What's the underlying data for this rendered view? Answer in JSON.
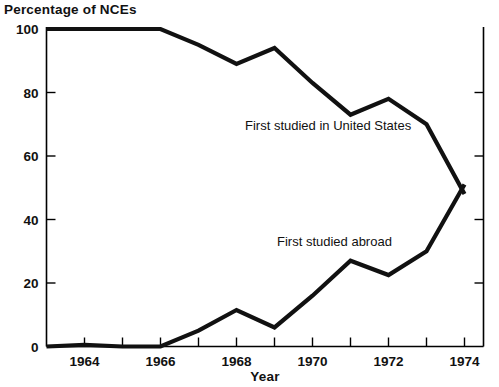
{
  "chart_data": {
    "type": "line",
    "title": "Percentage  of NCEs",
    "xlabel": "Year",
    "ylabel": "Percentage  of NCEs",
    "xlim": [
      1963,
      1974.5
    ],
    "ylim": [
      0,
      100
    ],
    "grid": false,
    "legend_position": "inline-annotation",
    "x": [
      1963,
      1964,
      1965,
      1966,
      1967,
      1968,
      1969,
      1970,
      1971,
      1972,
      1973,
      1974
    ],
    "xtick_labels": [
      "1964",
      "1966",
      "1968",
      "1970",
      "1972",
      "1974"
    ],
    "xtick_values": [
      1964,
      1966,
      1968,
      1970,
      1972,
      1974
    ],
    "ytick_labels": [
      "0",
      "20",
      "40",
      "60",
      "80",
      "100"
    ],
    "ytick_values": [
      0,
      20,
      40,
      60,
      80,
      100
    ],
    "series": [
      {
        "name": "First studied in United States",
        "values": [
          100,
          100,
          100,
          100,
          95,
          89,
          94,
          83,
          73,
          78,
          70,
          48
        ]
      },
      {
        "name": "First studied abroad",
        "values": [
          0,
          0.5,
          0,
          0,
          5,
          11.5,
          6,
          16,
          27,
          22.5,
          30,
          51
        ]
      }
    ],
    "annotations": [
      {
        "text": "First studied in United States",
        "x_px": 245,
        "y_px": 130
      },
      {
        "text": "First studied abroad",
        "x_px": 277,
        "y_px": 246
      }
    ]
  }
}
